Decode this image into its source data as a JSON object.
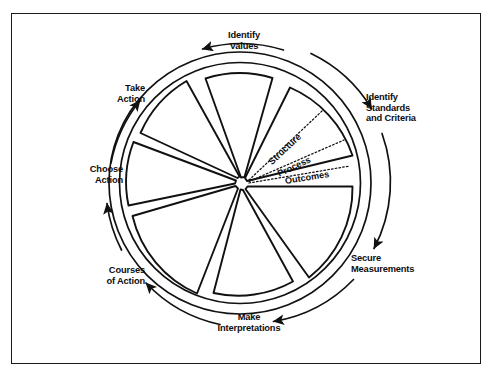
{
  "figure": {
    "type": "cycle-wheel-diagram",
    "frame": {
      "border_color": "#1a1a1a"
    },
    "wheel": {
      "center": {
        "x": 240,
        "y": 183
      },
      "rim_outer_radius": 131,
      "rim_inner_radius": 120,
      "sector_outer_radius": 113,
      "sector_count": 7,
      "stroke_color": "#111111"
    },
    "cycle_steps": [
      {
        "id": "identify-values",
        "label": "Identify\nValues",
        "position": "top"
      },
      {
        "id": "identify-standards-and-criteria",
        "label": "Identify\nStandards\nand Criteria",
        "position": "upper-right"
      },
      {
        "id": "secure-measurements",
        "label": "Secure\nMeasurements",
        "position": "lower-right"
      },
      {
        "id": "make-interpretations",
        "label": "Make\nInterpretations",
        "position": "bottom"
      },
      {
        "id": "courses-of-action",
        "label": "Courses\nof Action",
        "position": "lower-left"
      },
      {
        "id": "choose-action",
        "label": "Choose\nAction",
        "position": "left"
      },
      {
        "id": "take-action",
        "label": "Take\nAction",
        "position": "upper-left"
      }
    ],
    "labels": {
      "identify_values": "Identify\nValues",
      "identify_standards": "Identify\nStandards\nand Criteria",
      "secure_measurements": "Secure\nMeasurements",
      "make_interpretations": "Make\nInterpretations",
      "courses_of_action": "Courses\nof Action",
      "choose_action": "Choose\nAction",
      "take_action": "Take\nAction"
    },
    "sector_subdivisions": {
      "sector": "identify-standards-and-criteria",
      "line_style": "dotted",
      "items": [
        {
          "id": "structure",
          "label": "Structure"
        },
        {
          "id": "process",
          "label": "Process"
        },
        {
          "id": "outcomes",
          "label": "Outcomes"
        }
      ]
    },
    "arrows": {
      "direction": "clockwise",
      "count": 7,
      "style": "curved-outside-rim"
    }
  }
}
